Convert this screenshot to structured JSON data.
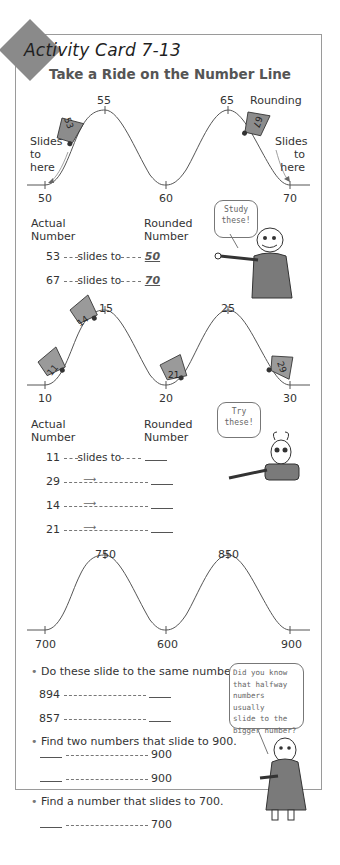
{
  "header": {
    "card_label": "Activity Card 7-13",
    "title": "Take a Ride on the Number Line"
  },
  "section1": {
    "peaks": [
      "55",
      "65"
    ],
    "baseline_ticks": [
      "50",
      "60",
      "70"
    ],
    "cars": [
      "53",
      "67"
    ],
    "left_note": [
      "Slides",
      "to",
      "here"
    ],
    "right_note": [
      "Slides",
      "to",
      "here"
    ],
    "rounding_label": "Rounding",
    "actual_header": [
      "Actual",
      "Number"
    ],
    "rounded_header": [
      "Rounded",
      "Number"
    ],
    "bubble_text": [
      "Study",
      "these!"
    ],
    "rows": [
      {
        "actual": "53",
        "connector": "slides to",
        "rounded": "50"
      },
      {
        "actual": "67",
        "connector": "slides to",
        "rounded": "70"
      }
    ]
  },
  "section2": {
    "peaks": [
      "15",
      "25"
    ],
    "baseline_ticks": [
      "10",
      "20",
      "30"
    ],
    "cars": [
      "11",
      "14",
      "21",
      "29"
    ],
    "actual_header": [
      "Actual",
      "Number"
    ],
    "rounded_header": [
      "Rounded",
      "Number"
    ],
    "bubble_text": [
      "Try",
      "these!"
    ],
    "rows": [
      {
        "actual": "11",
        "connector": "slides to",
        "rounded": ""
      },
      {
        "actual": "29",
        "connector": "arrow",
        "rounded": ""
      },
      {
        "actual": "14",
        "connector": "arrow",
        "rounded": ""
      },
      {
        "actual": "21",
        "connector": "arrow",
        "rounded": ""
      }
    ]
  },
  "section3": {
    "peaks": [
      "750",
      "850"
    ],
    "baseline_ticks": [
      "700",
      "600",
      "900"
    ],
    "q1": "Do these slide to the same number?",
    "q1_rows": [
      "894",
      "857"
    ],
    "q2": "Find two numbers that slide to 900.",
    "q2_rows": [
      "900",
      "900"
    ],
    "q3": "Find a number that slides to 700.",
    "q3_rows": [
      "700"
    ],
    "bubble_text": [
      "Did you know",
      "that halfway",
      "numbers usually",
      "slide to the",
      "bigger number?"
    ]
  },
  "colors": {
    "diamond": "#8a8a8a",
    "border": "#9a9a9a",
    "curve": "#555555"
  }
}
